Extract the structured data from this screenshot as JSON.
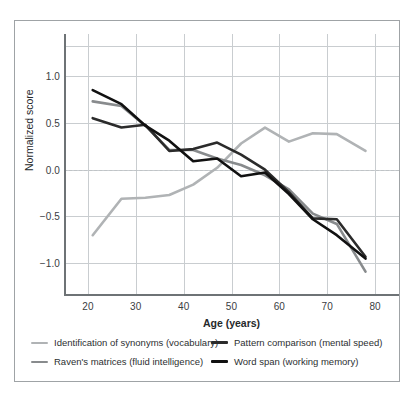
{
  "figure": {
    "border_color": "#9fa3a6"
  },
  "chart_data": {
    "type": "line",
    "title": "",
    "xlabel": "Age (years)",
    "ylabel": "Normalized score",
    "xlim": [
      15,
      85
    ],
    "ylim": [
      -1.35,
      1.45
    ],
    "xticks": [
      20,
      30,
      40,
      50,
      60,
      70,
      80
    ],
    "yticks": [
      1.0,
      0.5,
      0.0,
      -0.5,
      -1.0
    ],
    "ytick_labels": [
      "1.0",
      "0.5",
      "0.0",
      "−0.5",
      "−1.0"
    ],
    "grid": true,
    "zero_reference_line": true,
    "legend_position": "below",
    "series": [
      {
        "name": "Identification of synonyms (vocabulary)",
        "color": "#b0b3b5",
        "width": 2.6,
        "x": [
          21,
          27,
          32,
          37,
          42,
          47,
          52,
          57,
          62,
          67,
          72,
          78
        ],
        "y": [
          -0.7,
          -0.31,
          -0.3,
          -0.27,
          -0.16,
          0.02,
          0.28,
          0.45,
          0.3,
          0.39,
          0.38,
          0.2
        ]
      },
      {
        "name": "Raven's matrices (fluid intelligence)",
        "color": "#888b8d",
        "width": 2.6,
        "x": [
          21,
          27,
          32,
          37,
          42,
          47,
          52,
          57,
          62,
          67,
          72,
          78
        ],
        "y": [
          0.73,
          0.68,
          0.47,
          0.21,
          0.21,
          0.12,
          0.05,
          -0.06,
          -0.21,
          -0.47,
          -0.58,
          -1.09
        ]
      },
      {
        "name": "Pattern comparison (mental speed)",
        "color": "#2b2b2b",
        "width": 2.6,
        "x": [
          21,
          27,
          32,
          37,
          42,
          47,
          52,
          57,
          62,
          67,
          72,
          78
        ],
        "y": [
          0.55,
          0.45,
          0.48,
          0.2,
          0.22,
          0.29,
          0.16,
          0.0,
          -0.24,
          -0.52,
          -0.53,
          -0.93
        ]
      },
      {
        "name": "Word span (working memory)",
        "color": "#111111",
        "width": 2.6,
        "x": [
          21,
          27,
          32,
          37,
          42,
          47,
          52,
          57,
          62,
          67,
          72,
          78
        ],
        "y": [
          0.85,
          0.7,
          0.47,
          0.31,
          0.09,
          0.12,
          -0.07,
          -0.03,
          -0.26,
          -0.53,
          -0.7,
          -0.95
        ]
      }
    ]
  },
  "legend": [
    {
      "label": "Identification of synonyms (vocabulary)",
      "color": "#b0b3b5"
    },
    {
      "label": "Pattern comparison (mental speed)",
      "color": "#2b2b2b"
    },
    {
      "label": "Raven's matrices (fluid intelligence)",
      "color": "#888b8d"
    },
    {
      "label": "Word span (working memory)",
      "color": "#111111"
    }
  ]
}
